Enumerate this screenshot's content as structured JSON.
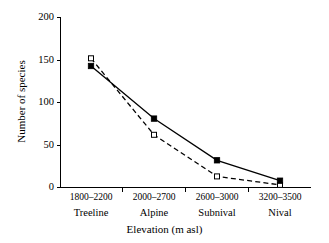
{
  "chart_data": {
    "type": "line",
    "title": "",
    "xlabel": "Elevation (m asl)",
    "ylabel": "Number of species",
    "categories": [
      "1800–2200",
      "2000–2700",
      "2600–3000",
      "3200–3500"
    ],
    "category_zones": [
      "Treeline",
      "Alpine",
      "Subnival",
      "Nival"
    ],
    "ylim": [
      0,
      200
    ],
    "yticks": [
      0,
      50,
      100,
      150,
      200
    ],
    "grid": false,
    "legend": "none",
    "series": [
      {
        "name": "solid-line-series",
        "line_style": "solid",
        "marker": "filled-square",
        "values": [
          143,
          81,
          32,
          8
        ]
      },
      {
        "name": "dashed-line-series",
        "line_style": "dashed",
        "marker": "open-square",
        "values": [
          152,
          62,
          13,
          3
        ]
      }
    ]
  },
  "axes": {
    "y_tick_labels": [
      "200",
      "150",
      "100",
      "50",
      "0"
    ],
    "x_tick_ranges": [
      "1800–2200",
      "2000–2700",
      "2600–3000",
      "3200–3500"
    ],
    "x_tick_zones": [
      "Treeline",
      "Alpine",
      "Subnival",
      "Nival"
    ],
    "x_axis_title": "Elevation (m asl)",
    "y_axis_title": "Number of species"
  },
  "colors": {
    "axis": "#000000",
    "series_solid": "#000000",
    "series_dashed": "#000000",
    "background": "#ffffff"
  }
}
